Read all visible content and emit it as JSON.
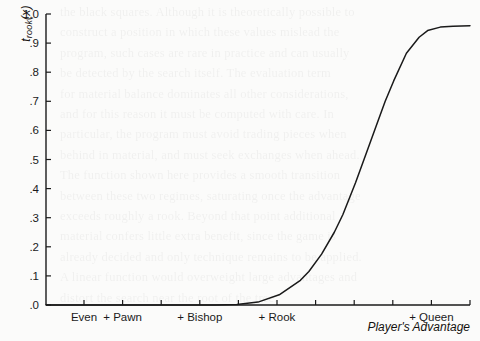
{
  "chart_data": {
    "type": "line",
    "title": "",
    "subtitle": "",
    "ylabel_full": "t_rook(x)",
    "ylabel_main": "t",
    "ylabel_sub": "rook",
    "ylabel_arg": "(x)",
    "xlabel": "Player's Advantage",
    "ylim": [
      0.0,
      1.0
    ],
    "ytick_values": [
      0.0,
      0.1,
      0.2,
      0.3,
      0.4,
      0.5,
      0.6,
      0.7,
      0.8,
      0.9,
      1.0
    ],
    "ytick_labels": [
      ".0",
      ".1",
      ".2",
      ".3",
      ".4",
      ".5",
      ".6",
      ".7",
      ".8",
      ".9",
      "1.0"
    ],
    "xtick_count": 10,
    "xtick_labels": [
      "Even",
      "+ Pawn",
      "+ Bishop",
      "+ Rook",
      "+ Queen"
    ],
    "xtick_label_index": [
      0,
      1,
      3,
      5,
      9
    ],
    "grid": false,
    "legend": null,
    "series": [
      {
        "name": "t_rook",
        "x": [
          0.0,
          0.1,
          0.2,
          0.3,
          0.4,
          0.45,
          0.5,
          0.55,
          0.6,
          0.62,
          0.65,
          0.68,
          0.7,
          0.73,
          0.75,
          0.78,
          0.8,
          0.82,
          0.85,
          0.88,
          0.9,
          0.93,
          0.96,
          1.0
        ],
        "values": [
          0.0,
          0.0,
          0.0,
          0.0,
          0.0,
          0.002,
          0.01,
          0.035,
          0.085,
          0.115,
          0.175,
          0.25,
          0.31,
          0.42,
          0.5,
          0.62,
          0.7,
          0.77,
          0.865,
          0.92,
          0.943,
          0.955,
          0.958,
          0.96
        ]
      }
    ],
    "plateau_value": 0.96,
    "inflection_x_label": "+ Rook"
  },
  "ghost_text": {
    "lines": [
      "the black squares. Although it is theoretically possible to",
      "construct a position in which these values mislead the",
      "program, such cases are rare in practice and can usually",
      "be detected by the search itself. The evaluation term",
      "for material balance dominates all other considerations,",
      "and for this reason it must be computed with care. In",
      "particular, the program must avoid trading pieces when",
      "behind in material, and must seek exchanges when ahead.",
      "The function shown here provides a smooth transition",
      "between these two regimes, saturating once the advantage",
      "exceeds roughly a rook. Beyond that point additional",
      "material confers little extra benefit, since the game is",
      "already decided and only technique remains to be applied.",
      "A linear function would overweight large advantages and",
      "distort the search near the root of the tree."
    ]
  }
}
